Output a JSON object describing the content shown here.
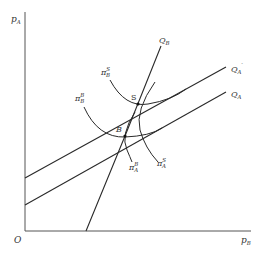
{
  "diagram": {
    "axes": {
      "y_label": {
        "base": "p",
        "sub": "A"
      },
      "x_label": {
        "base": "p",
        "sub": "B"
      },
      "origin_label": "O"
    },
    "lines": [
      {
        "id": "QB",
        "label_base": "Q",
        "label_sub": "B",
        "label_prime": ""
      },
      {
        "id": "QA_prime",
        "label_base": "Q",
        "label_sub": "A",
        "label_prime": "′"
      },
      {
        "id": "QA",
        "label_base": "Q",
        "label_sub": "A",
        "label_prime": ""
      }
    ],
    "points": [
      {
        "id": "S",
        "label": "S"
      },
      {
        "id": "B",
        "label": "B"
      }
    ],
    "curves": [
      {
        "id": "piB_S",
        "label_base": "π",
        "label_sup": "S",
        "label_sub": "B"
      },
      {
        "id": "piB_B",
        "label_base": "π",
        "label_sup": "B",
        "label_sub": "B"
      },
      {
        "id": "piA_B",
        "label_base": "π",
        "label_sup": "B",
        "label_sub": "A"
      },
      {
        "id": "piA_S",
        "label_base": "π",
        "label_sup": "S",
        "label_sub": "A"
      }
    ]
  }
}
